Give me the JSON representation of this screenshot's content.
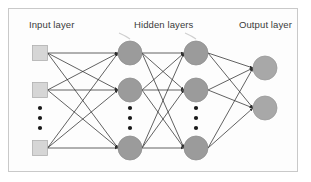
{
  "diagram": {
    "type": "neural-network-diagram",
    "frame": {
      "x": 8,
      "y": 8,
      "width": 290,
      "height": 164,
      "border_color": "#c9c9c9",
      "background_color": "#fdfdfd"
    },
    "page_background": "#ffffff",
    "labels": {
      "input": "Input layer",
      "hidden": "Hidden layers",
      "output": "Output layer",
      "color": "#3a3a3a"
    },
    "colors": {
      "input_node_fill": "#d6d6d6",
      "input_node_stroke": "#b0b0b0",
      "hidden_node_fill": "#9b9b9b",
      "hidden_node_stroke": "#8f8f8f",
      "output_node_fill": "#a8a8a8",
      "output_node_stroke": "#9a9a9a",
      "edge_color": "#2e2e2e",
      "ellipsis_color": "#1a1a1a",
      "pointer_color": "#cfcfcf"
    },
    "layers": [
      {
        "id": "input",
        "name": "Input layer",
        "shape": "square",
        "x": 40,
        "node_size": 15,
        "nodes": [
          {
            "id": "i1",
            "y": 53
          },
          {
            "id": "i2",
            "y": 90
          },
          {
            "id": "i3",
            "y": 148
          }
        ],
        "has_ellipsis": true,
        "ellipsis_dots": 3,
        "ellipsis_y": [
          108,
          118,
          128
        ]
      },
      {
        "id": "hidden1",
        "name": "Hidden layer 1",
        "shape": "circle",
        "x": 130,
        "node_size": 12,
        "nodes": [
          {
            "id": "h1a",
            "y": 53
          },
          {
            "id": "h1b",
            "y": 90
          },
          {
            "id": "h1c",
            "y": 148
          }
        ],
        "has_ellipsis": true,
        "ellipsis_dots": 3,
        "ellipsis_y": [
          108,
          118,
          128
        ]
      },
      {
        "id": "hidden2",
        "name": "Hidden layer 2",
        "shape": "circle",
        "x": 196,
        "node_size": 12,
        "nodes": [
          {
            "id": "h2a",
            "y": 53
          },
          {
            "id": "h2b",
            "y": 90
          },
          {
            "id": "h2c",
            "y": 148
          }
        ],
        "has_ellipsis": true,
        "ellipsis_dots": 3,
        "ellipsis_y": [
          108,
          118,
          128
        ]
      },
      {
        "id": "output",
        "name": "Output layer",
        "shape": "circle",
        "x": 265,
        "node_size": 12,
        "nodes": [
          {
            "id": "o1",
            "y": 68
          },
          {
            "id": "o2",
            "y": 108
          }
        ],
        "has_ellipsis": false,
        "ellipsis_dots": 0,
        "ellipsis_y": []
      }
    ],
    "connections": {
      "fully_connected": true,
      "arrowheads": true,
      "between": [
        [
          "input",
          "hidden1"
        ],
        [
          "hidden1",
          "hidden2"
        ],
        [
          "hidden2",
          "output"
        ]
      ]
    },
    "pointers": [
      {
        "id": "pointer-hidden1",
        "to_x": 130,
        "label_ref": "hidden"
      },
      {
        "id": "pointer-hidden2",
        "to_x": 196,
        "label_ref": "hidden"
      }
    ]
  }
}
